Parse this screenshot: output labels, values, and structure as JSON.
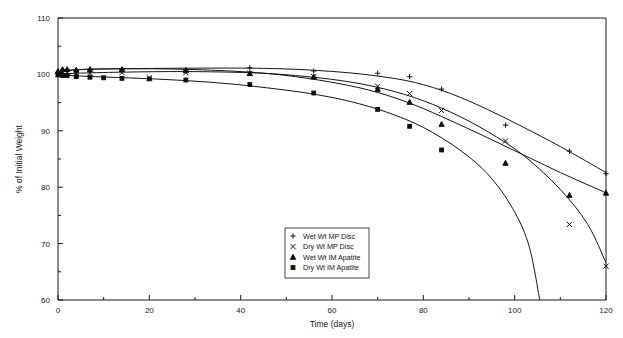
{
  "chart_data": {
    "type": "line",
    "title": "",
    "xlabel": "Time (days)",
    "ylabel": "% of Initial Weight",
    "xlim": [
      0,
      120
    ],
    "ylim": [
      60,
      110
    ],
    "grid": false,
    "legend_position": "inside-bottom-center",
    "x_ticks": [
      0,
      20,
      40,
      60,
      80,
      100,
      120
    ],
    "x_minor_ticks": [
      10,
      30,
      50,
      70,
      90,
      110
    ],
    "y_ticks": [
      60,
      70,
      80,
      90,
      100,
      110
    ],
    "y_minor_ticks": [
      65,
      75,
      85,
      95,
      105
    ],
    "x_tick_labels": [
      "0",
      "20",
      "40",
      "60",
      "80",
      "100",
      "120"
    ],
    "y_tick_labels": [
      "60",
      "70",
      "80",
      "90",
      "100",
      "110"
    ],
    "series": [
      {
        "name": "Wet Wt MP Disc",
        "marker": "plus",
        "points": [
          {
            "x": 0,
            "y": 100.1
          },
          {
            "x": 1,
            "y": 100.8
          },
          {
            "x": 2,
            "y": 100.9
          },
          {
            "x": 4,
            "y": 100.8
          },
          {
            "x": 7,
            "y": 100.9
          },
          {
            "x": 14,
            "y": 100.9
          },
          {
            "x": 28,
            "y": 100.8
          },
          {
            "x": 42,
            "y": 101.2
          },
          {
            "x": 56,
            "y": 100.6
          },
          {
            "x": 70,
            "y": 100.2
          },
          {
            "x": 77,
            "y": 99.6
          },
          {
            "x": 84,
            "y": 97.4
          },
          {
            "x": 98,
            "y": 91.0
          },
          {
            "x": 112,
            "y": 86.4
          },
          {
            "x": 120,
            "y": 82.4
          }
        ],
        "curve": [
          {
            "x": 0,
            "y": 100.0
          },
          {
            "x": 2,
            "y": 100.7
          },
          {
            "x": 6,
            "y": 100.9
          },
          {
            "x": 14,
            "y": 101.0
          },
          {
            "x": 28,
            "y": 101.1
          },
          {
            "x": 42,
            "y": 101.1
          },
          {
            "x": 52,
            "y": 100.9
          },
          {
            "x": 62,
            "y": 100.4
          },
          {
            "x": 70,
            "y": 99.7
          },
          {
            "x": 78,
            "y": 98.6
          },
          {
            "x": 86,
            "y": 96.6
          },
          {
            "x": 94,
            "y": 93.8
          },
          {
            "x": 102,
            "y": 90.6
          },
          {
            "x": 110,
            "y": 87.2
          },
          {
            "x": 120,
            "y": 82.6
          }
        ]
      },
      {
        "name": "Dry Wt MP Disc",
        "marker": "cross",
        "points": [
          {
            "x": 0,
            "y": 100.0
          },
          {
            "x": 1,
            "y": 100.2
          },
          {
            "x": 2,
            "y": 100.3
          },
          {
            "x": 4,
            "y": 100.2
          },
          {
            "x": 7,
            "y": 100.2
          },
          {
            "x": 14,
            "y": 100.3
          },
          {
            "x": 20,
            "y": 99.4
          },
          {
            "x": 28,
            "y": 100.3
          },
          {
            "x": 42,
            "y": 100.2
          },
          {
            "x": 56,
            "y": 99.6
          },
          {
            "x": 70,
            "y": 97.9
          },
          {
            "x": 77,
            "y": 96.6
          },
          {
            "x": 84,
            "y": 93.6
          },
          {
            "x": 98,
            "y": 88.2
          },
          {
            "x": 112,
            "y": 73.4
          },
          {
            "x": 120,
            "y": 66.0
          }
        ],
        "curve": [
          {
            "x": 0,
            "y": 100.0
          },
          {
            "x": 4,
            "y": 100.2
          },
          {
            "x": 14,
            "y": 100.4
          },
          {
            "x": 28,
            "y": 100.5
          },
          {
            "x": 42,
            "y": 100.3
          },
          {
            "x": 52,
            "y": 99.8
          },
          {
            "x": 62,
            "y": 98.9
          },
          {
            "x": 70,
            "y": 97.7
          },
          {
            "x": 78,
            "y": 95.9
          },
          {
            "x": 86,
            "y": 93.3
          },
          {
            "x": 94,
            "y": 89.9
          },
          {
            "x": 102,
            "y": 85.6
          },
          {
            "x": 110,
            "y": 79.6
          },
          {
            "x": 116,
            "y": 73.4
          },
          {
            "x": 120,
            "y": 66.6
          }
        ]
      },
      {
        "name": "Wet Wt IM Apatite",
        "marker": "triangle",
        "points": [
          {
            "x": 0,
            "y": 100.6
          },
          {
            "x": 1,
            "y": 100.9
          },
          {
            "x": 2,
            "y": 100.9
          },
          {
            "x": 4,
            "y": 100.8
          },
          {
            "x": 7,
            "y": 100.9
          },
          {
            "x": 14,
            "y": 100.9
          },
          {
            "x": 28,
            "y": 100.7
          },
          {
            "x": 42,
            "y": 100.2
          },
          {
            "x": 56,
            "y": 99.6
          },
          {
            "x": 70,
            "y": 97.4
          },
          {
            "x": 77,
            "y": 95.1
          },
          {
            "x": 84,
            "y": 91.2
          },
          {
            "x": 98,
            "y": 84.3
          },
          {
            "x": 112,
            "y": 78.6
          },
          {
            "x": 120,
            "y": 79.0
          }
        ],
        "curve": [
          {
            "x": 0,
            "y": 100.3
          },
          {
            "x": 4,
            "y": 100.8
          },
          {
            "x": 14,
            "y": 101.0
          },
          {
            "x": 28,
            "y": 100.9
          },
          {
            "x": 42,
            "y": 100.4
          },
          {
            "x": 52,
            "y": 99.6
          },
          {
            "x": 62,
            "y": 98.3
          },
          {
            "x": 70,
            "y": 96.8
          },
          {
            "x": 78,
            "y": 94.6
          },
          {
            "x": 86,
            "y": 91.8
          },
          {
            "x": 94,
            "y": 88.8
          },
          {
            "x": 102,
            "y": 85.7
          },
          {
            "x": 110,
            "y": 82.6
          },
          {
            "x": 120,
            "y": 79.0
          }
        ]
      },
      {
        "name": "Dry Wt IM Apatite",
        "marker": "square",
        "points": [
          {
            "x": 0,
            "y": 99.9
          },
          {
            "x": 1,
            "y": 99.8
          },
          {
            "x": 2,
            "y": 99.8
          },
          {
            "x": 4,
            "y": 99.6
          },
          {
            "x": 7,
            "y": 99.5
          },
          {
            "x": 10,
            "y": 99.4
          },
          {
            "x": 14,
            "y": 99.3
          },
          {
            "x": 20,
            "y": 99.2
          },
          {
            "x": 28,
            "y": 99.0
          },
          {
            "x": 42,
            "y": 98.2
          },
          {
            "x": 56,
            "y": 96.7
          },
          {
            "x": 70,
            "y": 93.8
          },
          {
            "x": 77,
            "y": 90.8
          },
          {
            "x": 84,
            "y": 86.6
          }
        ],
        "curve": [
          {
            "x": 0,
            "y": 99.9
          },
          {
            "x": 8,
            "y": 99.6
          },
          {
            "x": 18,
            "y": 99.3
          },
          {
            "x": 28,
            "y": 98.9
          },
          {
            "x": 38,
            "y": 98.3
          },
          {
            "x": 48,
            "y": 97.4
          },
          {
            "x": 56,
            "y": 96.5
          },
          {
            "x": 64,
            "y": 95.2
          },
          {
            "x": 72,
            "y": 93.3
          },
          {
            "x": 80,
            "y": 90.6
          },
          {
            "x": 88,
            "y": 86.6
          },
          {
            "x": 94,
            "y": 82.4
          },
          {
            "x": 99,
            "y": 77.0
          },
          {
            "x": 103,
            "y": 70.0
          },
          {
            "x": 105.5,
            "y": 60.0
          }
        ]
      }
    ]
  },
  "legend": {
    "entries": [
      {
        "label": "Wet Wt MP Disc",
        "marker": "plus"
      },
      {
        "label": "Dry Wt MP Disc",
        "marker": "cross"
      },
      {
        "label": "Wet Wt IM Apatite",
        "marker": "triangle"
      },
      {
        "label": "Dry Wt IM Apatite",
        "marker": "square"
      }
    ]
  },
  "colors": {
    "ink": "#1a1a1a",
    "background": "#ffffff"
  }
}
